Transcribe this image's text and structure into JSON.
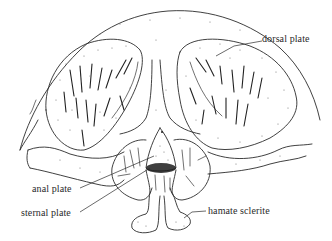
{
  "figure": {
    "labels": {
      "dorsal_plate": "dorsal plate",
      "anal_plate": "anal plate",
      "sternal_plate": "sternal plate",
      "hamate_sclerite": "hamate sclerite"
    },
    "colors": {
      "ink": "#2b2b2b",
      "background": "#ffffff",
      "stipple": "#777777"
    }
  }
}
